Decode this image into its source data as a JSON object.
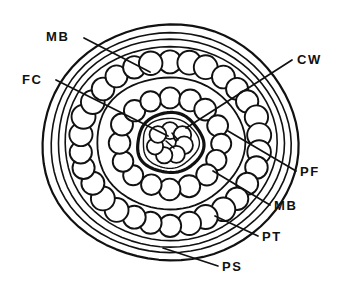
{
  "figure": {
    "kind": "cable-cross-section-diagram",
    "background_color": "#ffffff",
    "line_color": "#111111",
    "fill_color": "#ffffff",
    "title": ""
  },
  "geometry": {
    "center_x": 170,
    "center_y": 143,
    "outer_rings": [
      {
        "name": "PS",
        "rx": 128,
        "ry": 118,
        "stroke_width": 2.2
      },
      {
        "name": "PT",
        "rx": 120,
        "ry": 110,
        "stroke_width": 1.6
      },
      {
        "name": "MB-outer",
        "rx": 113,
        "ry": 104,
        "stroke_width": 1.6
      },
      {
        "name": "PF-boundary",
        "rx": 106,
        "ry": 97,
        "stroke_width": 1.6
      }
    ],
    "outer_wire_ring": {
      "name": "PF",
      "count": 30,
      "rx": 90,
      "ry": 82,
      "radius": 11.5
    },
    "mid_rings": [
      {
        "name": "MB-inner",
        "rx": 74,
        "ry": 66,
        "stroke_width": 1.8
      }
    ],
    "inner_wire_ring": {
      "name": "CW",
      "count": 16,
      "rx": 51,
      "ry": 46,
      "radius": 10.5
    },
    "core_ring": {
      "name": "FC-wall",
      "rx": 33,
      "ry": 30,
      "stroke_width": 3.2
    },
    "core_inner_ring": {
      "name": "FC-inner-wall",
      "rx": 28,
      "ry": 25,
      "stroke_width": 1.4
    },
    "core_wires": {
      "count": 7,
      "ring_rx": 15,
      "ring_ry": 13,
      "radius": 8.5,
      "center_radius": 8.5
    }
  },
  "labels": [
    {
      "id": "mb-top",
      "text": "MB",
      "x": 46,
      "y": 41,
      "anchor": "start",
      "leader": [
        [
          84,
          38
        ],
        [
          150,
          72
        ]
      ]
    },
    {
      "id": "fc",
      "text": "FC",
      "x": 22,
      "y": 84,
      "anchor": "start",
      "leader": [
        [
          56,
          80
        ],
        [
          168,
          136
        ]
      ]
    },
    {
      "id": "cw",
      "text": "CW",
      "x": 297,
      "y": 64,
      "anchor": "start",
      "leader": [
        [
          292,
          60
        ],
        [
          186,
          128
        ]
      ]
    },
    {
      "id": "pf",
      "text": "PF",
      "x": 300,
      "y": 176,
      "anchor": "start",
      "leader": [
        [
          296,
          171
        ],
        [
          228,
          131
        ]
      ]
    },
    {
      "id": "mb-right",
      "text": "MB",
      "x": 274,
      "y": 210,
      "anchor": "start",
      "leader": [
        [
          270,
          205
        ],
        [
          213,
          171
        ]
      ]
    },
    {
      "id": "pt",
      "text": "PT",
      "x": 262,
      "y": 241,
      "anchor": "start",
      "leader": [
        [
          258,
          236
        ],
        [
          215,
          216
        ]
      ]
    },
    {
      "id": "ps",
      "text": "PS",
      "x": 222,
      "y": 271,
      "anchor": "start",
      "leader": [
        [
          218,
          266
        ],
        [
          163,
          248
        ]
      ]
    }
  ]
}
